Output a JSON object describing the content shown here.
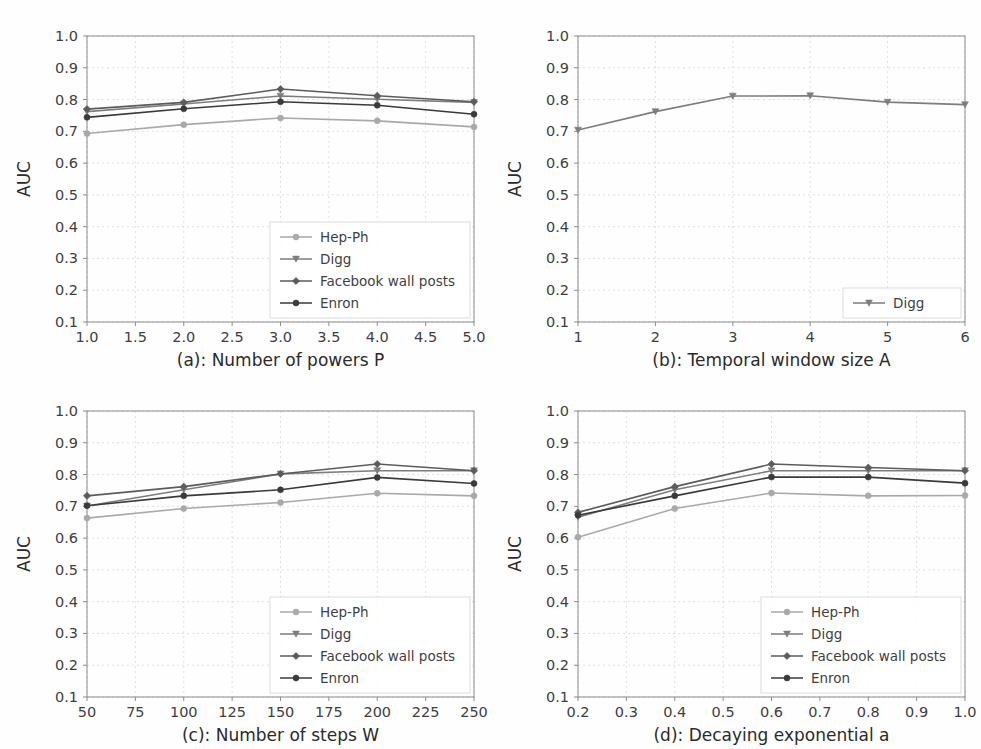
{
  "figure": {
    "background_color": "#fefefe",
    "grid_color": "#d8d8d8",
    "axis_color": "#8c8c8c",
    "ylabel": "AUC",
    "ylim": [
      0.1,
      1.0
    ],
    "yticks": [
      "0.1",
      "0.2",
      "0.3",
      "0.4",
      "0.5",
      "0.6",
      "0.7",
      "0.8",
      "0.9",
      "1.0"
    ],
    "ytick_values": [
      0.1,
      0.2,
      0.3,
      0.4,
      0.5,
      0.6,
      0.7,
      0.8,
      0.9,
      1.0
    ]
  },
  "series_style": {
    "hep_ph": {
      "name": "Hep-Ph",
      "color": "#a9a9a9",
      "marker": "circle"
    },
    "digg": {
      "name": "Digg",
      "color": "#7d7d7d",
      "marker": "triangle-down"
    },
    "facebook": {
      "name": "Facebook wall posts",
      "color": "#5c5c5c",
      "marker": "diamond"
    },
    "enron": {
      "name": "Enron",
      "color": "#3a3a3a",
      "marker": "circle"
    }
  },
  "chart_data": [
    {
      "id": "a",
      "type": "line",
      "title": "",
      "xlabel": "(a): Number of powers P",
      "ylabel": "AUC",
      "xlim": [
        1.0,
        5.0
      ],
      "ylim": [
        0.1,
        1.0
      ],
      "grid": true,
      "legend_position": "lower right",
      "xticks": [
        "1.0",
        "1.5",
        "2.0",
        "2.5",
        "3.0",
        "3.5",
        "4.0",
        "4.5",
        "5.0"
      ],
      "xtick_values": [
        1.0,
        1.5,
        2.0,
        2.5,
        3.0,
        3.5,
        4.0,
        4.5,
        5.0
      ],
      "x": [
        1.0,
        2.0,
        3.0,
        4.0,
        5.0
      ],
      "series": [
        {
          "key": "hep_ph",
          "name": "Hep-Ph",
          "values": [
            0.693,
            0.721,
            0.742,
            0.733,
            0.714
          ]
        },
        {
          "key": "digg",
          "name": "Digg",
          "values": [
            0.762,
            0.786,
            0.811,
            0.801,
            0.791
          ]
        },
        {
          "key": "facebook",
          "name": "Facebook wall posts",
          "values": [
            0.77,
            0.791,
            0.833,
            0.812,
            0.793
          ]
        },
        {
          "key": "enron",
          "name": "Enron",
          "values": [
            0.744,
            0.771,
            0.793,
            0.782,
            0.754
          ]
        }
      ]
    },
    {
      "id": "b",
      "type": "line",
      "title": "",
      "xlabel": "(b): Temporal window size A",
      "ylabel": "AUC",
      "xlim": [
        1,
        6
      ],
      "ylim": [
        0.1,
        1.0
      ],
      "grid": true,
      "legend_position": "lower right",
      "xticks": [
        "1",
        "2",
        "3",
        "4",
        "5",
        "6"
      ],
      "xtick_values": [
        1,
        2,
        3,
        4,
        5,
        6
      ],
      "x": [
        1,
        2,
        3,
        4,
        5,
        6
      ],
      "series": [
        {
          "key": "digg",
          "name": "Digg",
          "values": [
            0.704,
            0.762,
            0.811,
            0.812,
            0.792,
            0.784
          ]
        }
      ]
    },
    {
      "id": "c",
      "type": "line",
      "title": "",
      "xlabel": "(c): Number of steps W",
      "ylabel": "AUC",
      "xlim": [
        50,
        250
      ],
      "ylim": [
        0.1,
        1.0
      ],
      "grid": true,
      "legend_position": "lower right",
      "xticks": [
        "50",
        "75",
        "100",
        "125",
        "150",
        "175",
        "200",
        "225",
        "250"
      ],
      "xtick_values": [
        50,
        75,
        100,
        125,
        150,
        175,
        200,
        225,
        250
      ],
      "x": [
        50,
        100,
        150,
        200,
        250
      ],
      "series": [
        {
          "key": "hep_ph",
          "name": "Hep-Ph",
          "values": [
            0.663,
            0.693,
            0.712,
            0.741,
            0.733
          ]
        },
        {
          "key": "digg",
          "name": "Digg",
          "values": [
            0.701,
            0.752,
            0.802,
            0.812,
            0.812
          ]
        },
        {
          "key": "facebook",
          "name": "Facebook wall posts",
          "values": [
            0.733,
            0.762,
            0.802,
            0.833,
            0.812
          ]
        },
        {
          "key": "enron",
          "name": "Enron",
          "values": [
            0.702,
            0.733,
            0.752,
            0.791,
            0.772
          ]
        }
      ]
    },
    {
      "id": "d",
      "type": "line",
      "title": "",
      "xlabel": "(d): Decaying exponential a",
      "ylabel": "AUC",
      "xlim": [
        0.2,
        1.0
      ],
      "ylim": [
        0.1,
        1.0
      ],
      "grid": true,
      "legend_position": "lower right",
      "xticks": [
        "0.2",
        "0.3",
        "0.4",
        "0.5",
        "0.6",
        "0.7",
        "0.8",
        "0.9",
        "1.0"
      ],
      "xtick_values": [
        0.2,
        0.3,
        0.4,
        0.5,
        0.6,
        0.7,
        0.8,
        0.9,
        1.0
      ],
      "x": [
        0.2,
        0.4,
        0.6,
        0.8,
        1.0
      ],
      "series": [
        {
          "key": "hep_ph",
          "name": "Hep-Ph",
          "values": [
            0.603,
            0.693,
            0.742,
            0.733,
            0.734
          ]
        },
        {
          "key": "digg",
          "name": "Digg",
          "values": [
            0.666,
            0.752,
            0.812,
            0.812,
            0.812
          ]
        },
        {
          "key": "facebook",
          "name": "Facebook wall posts",
          "values": [
            0.681,
            0.762,
            0.833,
            0.822,
            0.812
          ]
        },
        {
          "key": "enron",
          "name": "Enron",
          "values": [
            0.672,
            0.733,
            0.792,
            0.792,
            0.773
          ]
        }
      ]
    }
  ]
}
